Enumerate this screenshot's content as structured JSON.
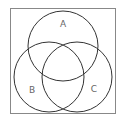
{
  "diagram": {
    "type": "venn",
    "universe_box": {
      "x": 10,
      "y": 8,
      "width": 105,
      "height": 105,
      "stroke": "#888888"
    },
    "sets": [
      {
        "label": "A",
        "cx": 63,
        "cy": 46,
        "r": 35,
        "label_x": 63,
        "label_y": 27
      },
      {
        "label": "B",
        "cx": 49,
        "cy": 77,
        "r": 35,
        "label_x": 32,
        "label_y": 93
      },
      {
        "label": "C",
        "cx": 77,
        "cy": 77,
        "r": 35,
        "label_x": 94,
        "label_y": 92
      }
    ],
    "stroke_color": "#333333",
    "label_color": "#666666"
  }
}
